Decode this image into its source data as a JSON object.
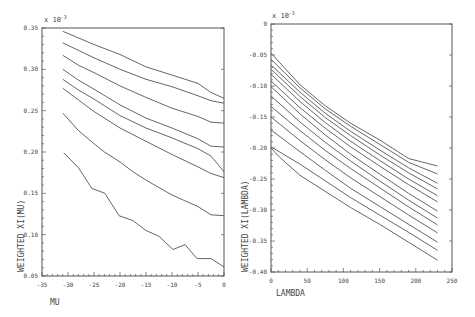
{
  "chart_data": [
    {
      "type": "line",
      "title": "",
      "xlabel": "MU",
      "ylabel": "WEIGHTED XI(MU)",
      "y_scale_note": "x 10^-3",
      "xlim": [
        -35,
        0
      ],
      "ylim": [
        0.05,
        0.35
      ],
      "grid": false,
      "legend": "none",
      "x_ticks": [
        "-35",
        "-30",
        "-25",
        "-20",
        "-15",
        "-10",
        "-5",
        "0"
      ],
      "y_ticks": [
        "0.05",
        "0.10",
        "0.15",
        "0.20",
        "0.25",
        "0.30",
        "0.35"
      ],
      "series": [
        {
          "name": "curve-1",
          "x": [
            -31,
            -25,
            -20,
            -15,
            -10,
            -5,
            -2.5,
            0
          ],
          "y": [
            0.346,
            0.33,
            0.318,
            0.303,
            0.293,
            0.283,
            0.272,
            0.265
          ]
        },
        {
          "name": "curve-2",
          "x": [
            -31,
            -25,
            -20,
            -15,
            -10,
            -5,
            -2.5,
            0
          ],
          "y": [
            0.332,
            0.314,
            0.3,
            0.288,
            0.279,
            0.268,
            0.262,
            0.259
          ]
        },
        {
          "name": "curve-3",
          "x": [
            -31,
            -28,
            -25,
            -20,
            -15,
            -10,
            -5,
            -2.5,
            0
          ],
          "y": [
            0.317,
            0.305,
            0.296,
            0.28,
            0.266,
            0.253,
            0.243,
            0.236,
            0.235
          ]
        },
        {
          "name": "curve-4",
          "x": [
            -31,
            -28,
            -25,
            -20,
            -15,
            -10,
            -5,
            -2.5,
            0
          ],
          "y": [
            0.3,
            0.287,
            0.276,
            0.257,
            0.241,
            0.229,
            0.216,
            0.207,
            0.206
          ]
        },
        {
          "name": "curve-5",
          "x": [
            -31,
            -28,
            -25,
            -20,
            -15,
            -10,
            -5,
            -2.5,
            0
          ],
          "y": [
            0.288,
            0.275,
            0.264,
            0.244,
            0.229,
            0.217,
            0.204,
            0.195,
            0.176
          ]
        },
        {
          "name": "curve-6",
          "x": [
            -31,
            -28,
            -25,
            -20,
            -15,
            -10,
            -5,
            -2.5,
            0
          ],
          "y": [
            0.277,
            0.263,
            0.249,
            0.229,
            0.213,
            0.197,
            0.182,
            0.174,
            0.169
          ]
        },
        {
          "name": "curve-7",
          "x": [
            -31,
            -28,
            -25,
            -23,
            -20,
            -17.5,
            -15,
            -10,
            -5,
            -2.5,
            0
          ],
          "y": [
            0.247,
            0.226,
            0.21,
            0.2,
            0.188,
            0.176,
            0.166,
            0.148,
            0.134,
            0.124,
            0.123
          ]
        },
        {
          "name": "curve-8",
          "x": [
            -30.8,
            -28,
            -25.4,
            -22.9,
            -20.2,
            -17.5,
            -15,
            -12.5,
            -9.8,
            -7.5,
            -5.2,
            -2.5,
            0
          ],
          "y": [
            0.199,
            0.181,
            0.156,
            0.15,
            0.123,
            0.117,
            0.105,
            0.098,
            0.082,
            0.088,
            0.071,
            0.071,
            0.061
          ]
        }
      ]
    },
    {
      "type": "line",
      "title": "",
      "xlabel": "LAMBDA",
      "ylabel": "WEIGHTED XI(LAMBDA)",
      "y_scale_note": "x 10^-3",
      "xlim": [
        0,
        250
      ],
      "ylim": [
        -0.4,
        0
      ],
      "grid": false,
      "legend": "none",
      "x_ticks": [
        "0",
        "50",
        "100",
        "150",
        "200",
        "250"
      ],
      "y_ticks": [
        "0",
        "-0.05",
        "-0.10",
        "-0.15",
        "-0.20",
        "-0.25",
        "-0.30",
        "-0.35",
        "-0.40"
      ],
      "series": [
        {
          "name": "curve-1",
          "x": [
            0,
            40,
            75,
            110,
            150,
            190,
            230
          ],
          "y": [
            -0.047,
            -0.098,
            -0.132,
            -0.16,
            -0.187,
            -0.217,
            -0.229
          ]
        },
        {
          "name": "curve-2",
          "x": [
            0,
            40,
            75,
            110,
            150,
            190,
            230
          ],
          "y": [
            -0.057,
            -0.103,
            -0.137,
            -0.165,
            -0.194,
            -0.223,
            -0.242
          ]
        },
        {
          "name": "curve-3",
          "x": [
            0,
            40,
            75,
            110,
            150,
            190,
            230
          ],
          "y": [
            -0.066,
            -0.11,
            -0.144,
            -0.173,
            -0.203,
            -0.232,
            -0.257
          ]
        },
        {
          "name": "curve-4",
          "x": [
            0,
            40,
            75,
            110,
            150,
            190,
            230
          ],
          "y": [
            -0.073,
            -0.117,
            -0.151,
            -0.18,
            -0.211,
            -0.24,
            -0.266
          ]
        },
        {
          "name": "curve-5",
          "x": [
            0,
            40,
            75,
            110,
            150,
            190,
            230
          ],
          "y": [
            -0.081,
            -0.125,
            -0.159,
            -0.189,
            -0.22,
            -0.25,
            -0.277
          ]
        },
        {
          "name": "curve-6",
          "x": [
            0,
            40,
            75,
            110,
            150,
            190,
            230
          ],
          "y": [
            -0.092,
            -0.135,
            -0.168,
            -0.198,
            -0.229,
            -0.259,
            -0.287
          ]
        },
        {
          "name": "curve-7",
          "x": [
            0,
            40,
            75,
            110,
            150,
            190,
            230
          ],
          "y": [
            -0.101,
            -0.145,
            -0.179,
            -0.21,
            -0.242,
            -0.273,
            -0.302
          ]
        },
        {
          "name": "curve-8",
          "x": [
            0,
            40,
            75,
            110,
            150,
            190,
            230
          ],
          "y": [
            -0.116,
            -0.158,
            -0.191,
            -0.221,
            -0.253,
            -0.284,
            -0.313
          ]
        },
        {
          "name": "curve-9",
          "x": [
            0,
            40,
            75,
            110,
            150,
            190,
            230
          ],
          "y": [
            -0.133,
            -0.172,
            -0.204,
            -0.233,
            -0.264,
            -0.295,
            -0.324
          ]
        },
        {
          "name": "curve-10",
          "x": [
            0,
            40,
            75,
            110,
            150,
            190,
            230
          ],
          "y": [
            -0.15,
            -0.188,
            -0.219,
            -0.248,
            -0.278,
            -0.308,
            -0.337
          ]
        },
        {
          "name": "curve-11",
          "x": [
            0,
            40,
            75,
            110,
            150,
            190,
            230
          ],
          "y": [
            -0.171,
            -0.206,
            -0.236,
            -0.265,
            -0.294,
            -0.323,
            -0.352
          ]
        },
        {
          "name": "curve-12",
          "x": [
            0,
            40,
            75,
            110,
            150,
            190,
            230
          ],
          "y": [
            -0.198,
            -0.226,
            -0.253,
            -0.28,
            -0.308,
            -0.336,
            -0.365
          ]
        },
        {
          "name": "curve-13",
          "x": [
            0,
            12,
            40,
            75,
            110,
            150,
            190,
            230
          ],
          "y": [
            -0.2,
            -0.215,
            -0.244,
            -0.27,
            -0.296,
            -0.323,
            -0.352,
            -0.381
          ]
        }
      ]
    }
  ],
  "panels": [
    {
      "id": "mu-panel",
      "frame": {
        "x0": 42,
        "x1": 224,
        "y0": 28,
        "y1": 276
      }
    },
    {
      "id": "lambda-panel",
      "frame": {
        "x0": 271,
        "x1": 452,
        "y0": 24,
        "y1": 272
      }
    }
  ],
  "labels": {
    "left_scale": "x 10",
    "left_scale_exp": "-3",
    "right_scale": "x 10",
    "right_scale_exp": "-3",
    "left_xlabel": "MU",
    "left_ylabel": "WEIGHTED XI(MU)",
    "right_xlabel": "LAMBDA",
    "right_ylabel": "WEIGHTED XI(LAMBDA)"
  },
  "colors": {
    "line": "#555555",
    "background": "#ffffff",
    "text": "#444444"
  }
}
